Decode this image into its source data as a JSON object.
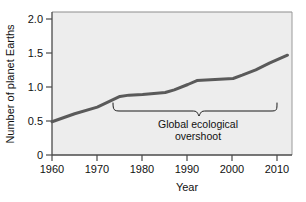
{
  "chart_data": {
    "type": "line",
    "title": "",
    "xlabel": "Year",
    "ylabel": "Number of planet Earths",
    "xlim": [
      1960,
      2013
    ],
    "ylim": [
      0,
      2.15
    ],
    "xticks": [
      1960,
      1970,
      1980,
      1990,
      2000,
      2010
    ],
    "xtick_labels": [
      "1960",
      "1970",
      "1980",
      "1990",
      "2000",
      "2010"
    ],
    "yticks": [
      0,
      0.5,
      1.0,
      1.5,
      2.0
    ],
    "ytick_labels": [
      "0",
      "0.5",
      "1.0",
      "1.5",
      "2.0"
    ],
    "grid": false,
    "legend": "none",
    "series": [
      {
        "name": "Humanity's Ecological Footprint",
        "color": "#5a5a5a",
        "x": [
          1960,
          1965,
          1970,
          1975,
          1977,
          1980,
          1985,
          1987,
          1990,
          1992,
          1995,
          2000,
          2002,
          2005,
          2008,
          2010,
          2012
        ],
        "values": [
          0.5,
          0.62,
          0.72,
          0.88,
          0.9,
          0.91,
          0.94,
          0.98,
          1.06,
          1.12,
          1.13,
          1.15,
          1.2,
          1.28,
          1.38,
          1.44,
          1.5
        ]
      }
    ],
    "annotations": [
      {
        "name": "global-ecological-overshoot",
        "text_line1": "Global ecological",
        "text_line2": "overshoot",
        "brace_x_start": 1975,
        "brace_x_end": 2011,
        "brace_y": 0.8
      }
    ],
    "colors": {
      "line": "#5a5a5a",
      "plot_background": "#ededed",
      "page_background": "#ffffff",
      "axis": "#555555",
      "text": "#111111"
    }
  },
  "axis": {
    "y_title": "Number of planet Earths",
    "x_title": "Year"
  }
}
